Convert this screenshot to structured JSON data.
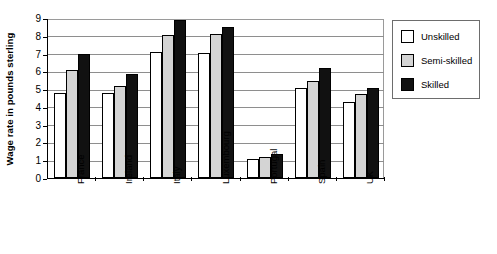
{
  "chart_data": {
    "type": "bar",
    "title": "",
    "xlabel": "",
    "ylabel": "Wage rate in pounds sterling",
    "ylim": [
      0,
      9
    ],
    "ytick_labels": [
      "0",
      "1",
      "2",
      "3",
      "4",
      "5",
      "6",
      "7",
      "8",
      "9"
    ],
    "grid": true,
    "legend_position": "right",
    "categories": [
      "France",
      "Ireland",
      "Italy",
      "Luxembourg",
      "Portugal",
      "Spain",
      "UK"
    ],
    "series": [
      {
        "name": "Unskilled",
        "color": "#ffffff",
        "values": [
          4.8,
          4.8,
          7.1,
          7.05,
          1.05,
          5.05,
          4.3
        ]
      },
      {
        "name": "Semi-skilled",
        "color": "#d4d4d4",
        "values": [
          6.1,
          5.15,
          8.05,
          8.1,
          1.2,
          5.45,
          4.7
        ]
      },
      {
        "name": "Skilled",
        "color": "#111111",
        "values": [
          6.95,
          5.85,
          8.9,
          8.5,
          1.35,
          6.2,
          5.05
        ]
      }
    ]
  }
}
